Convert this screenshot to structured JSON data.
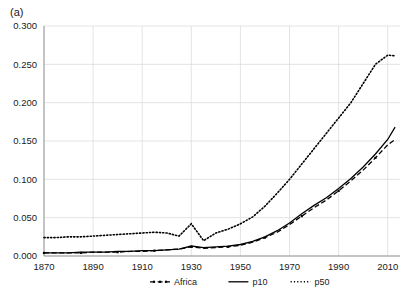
{
  "panel": {
    "label": "(a)"
  },
  "chart_data": {
    "type": "line",
    "title": "",
    "xlabel": "",
    "ylabel": "",
    "xlim": [
      1870,
      2015
    ],
    "ylim": [
      0.0,
      0.3
    ],
    "grid": true,
    "legend_position": "bottom",
    "xticks": [
      "1870",
      "1890",
      "1910",
      "1930",
      "1950",
      "1970",
      "1990",
      "2010"
    ],
    "xtick_values": [
      1870,
      1890,
      1910,
      1930,
      1950,
      1970,
      1990,
      2010
    ],
    "yticks": [
      "0.000",
      "0.050",
      "0.100",
      "0.150",
      "0.200",
      "0.250",
      "0.300"
    ],
    "ytick_values": [
      0.0,
      0.05,
      0.1,
      0.15,
      0.2,
      0.25,
      0.3
    ],
    "series": [
      {
        "name": "Africa",
        "style": "dashed-marker",
        "x": [
          1870,
          1875,
          1880,
          1885,
          1890,
          1895,
          1900,
          1905,
          1910,
          1915,
          1920,
          1925,
          1930,
          1935,
          1940,
          1945,
          1950,
          1955,
          1960,
          1965,
          1970,
          1975,
          1980,
          1985,
          1990,
          1995,
          2000,
          2005,
          2010,
          2013
        ],
        "values": [
          0.004,
          0.004,
          0.004,
          0.004,
          0.005,
          0.005,
          0.005,
          0.006,
          0.006,
          0.007,
          0.008,
          0.009,
          0.012,
          0.01,
          0.011,
          0.012,
          0.014,
          0.018,
          0.024,
          0.031,
          0.041,
          0.052,
          0.063,
          0.073,
          0.085,
          0.098,
          0.112,
          0.128,
          0.145,
          0.152
        ]
      },
      {
        "name": "p10",
        "style": "solid",
        "x": [
          1870,
          1875,
          1880,
          1885,
          1890,
          1895,
          1900,
          1905,
          1910,
          1915,
          1920,
          1925,
          1930,
          1935,
          1940,
          1945,
          1950,
          1955,
          1960,
          1965,
          1970,
          1975,
          1980,
          1985,
          1990,
          1995,
          2000,
          2005,
          2010,
          2013
        ],
        "values": [
          0.004,
          0.004,
          0.004,
          0.005,
          0.005,
          0.005,
          0.006,
          0.006,
          0.007,
          0.007,
          0.008,
          0.009,
          0.013,
          0.011,
          0.012,
          0.013,
          0.015,
          0.019,
          0.025,
          0.033,
          0.043,
          0.055,
          0.066,
          0.076,
          0.088,
          0.101,
          0.116,
          0.133,
          0.152,
          0.168
        ]
      },
      {
        "name": "p50",
        "style": "dotted",
        "x": [
          1870,
          1875,
          1880,
          1885,
          1890,
          1895,
          1900,
          1905,
          1910,
          1915,
          1920,
          1925,
          1930,
          1935,
          1940,
          1945,
          1950,
          1955,
          1960,
          1965,
          1970,
          1975,
          1980,
          1985,
          1990,
          1995,
          2000,
          2005,
          2010,
          2013
        ],
        "values": [
          0.024,
          0.024,
          0.025,
          0.025,
          0.026,
          0.027,
          0.028,
          0.029,
          0.03,
          0.031,
          0.03,
          0.026,
          0.042,
          0.02,
          0.03,
          0.035,
          0.042,
          0.051,
          0.065,
          0.082,
          0.1,
          0.12,
          0.14,
          0.16,
          0.18,
          0.2,
          0.225,
          0.25,
          0.262,
          0.261
        ]
      }
    ],
    "legend": [
      {
        "label": "Africa",
        "style": "dashed-marker"
      },
      {
        "label": "p10",
        "style": "solid"
      },
      {
        "label": "p50",
        "style": "dotted"
      }
    ],
    "colors": {
      "line": "#000000",
      "grid": "#d9d9d9",
      "axis": "#808080",
      "text": "#1a1a1a"
    }
  }
}
